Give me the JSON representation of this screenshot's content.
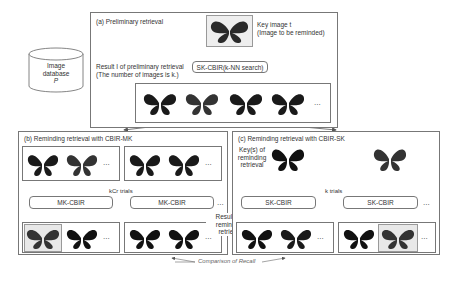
{
  "database": {
    "line1": "Image",
    "line2": "database",
    "line3": "P"
  },
  "panel_a": {
    "title": "(a) Preliminary retrieval",
    "key_label_1": "Key image t",
    "key_label_2": "(Image to be reminded)",
    "result_label_1": "Result I of preliminary retrieval",
    "result_label_2": "(The number of images is k.)",
    "process": "SK-CBIR(k-NN search)",
    "ellipsis": "..."
  },
  "panel_b": {
    "title": "(b) Reminding retrieval with CBIR-MK",
    "process_left": "MK-CBIR",
    "process_right": "MK-CBIR",
    "trials": "kCr trials",
    "ellipsis": "..."
  },
  "panel_c": {
    "title": "(c) Reminding retrieval with CBIR-SK",
    "keys_label_1": "Key(s) of",
    "keys_label_2": "reminding",
    "keys_label_3": "retrieval",
    "process_left": "SK-CBIR",
    "process_right": "SK-CBIR",
    "trials": "k trials",
    "ellipsis": "..."
  },
  "results_label": {
    "line1": "Results of",
    "line2": "reminding",
    "line3": "retrieval"
  },
  "comparison": "Comparison of Recall"
}
